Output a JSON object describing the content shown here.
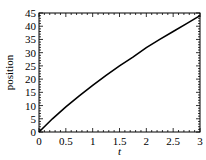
{
  "chart_data": {
    "type": "line",
    "title": "",
    "xlabel": "t",
    "ylabel": "position",
    "xlim": [
      0,
      3
    ],
    "ylim": [
      0,
      45
    ],
    "grid": false,
    "legend": null,
    "x_ticks": [
      0,
      0.5,
      1,
      1.5,
      2,
      2.5,
      3
    ],
    "x_tick_labels": [
      "0",
      "0.5",
      "1",
      "1.5",
      "2",
      "2.5",
      "3"
    ],
    "y_ticks": [
      0,
      5,
      10,
      15,
      20,
      25,
      30,
      35,
      40,
      45
    ],
    "y_tick_labels": [
      "0",
      "5",
      "10",
      "15",
      "20",
      "25",
      "30",
      "35",
      "40",
      "45"
    ],
    "series": [
      {
        "name": "position",
        "color": "#000000",
        "x": [
          0,
          0.25,
          0.5,
          0.75,
          1,
          1.25,
          1.5,
          1.75,
          2,
          2.25,
          2.5,
          2.75,
          3
        ],
        "values": [
          0,
          5,
          9.5,
          13.7,
          17.6,
          21.4,
          25,
          28.3,
          31.9,
          35,
          38,
          41,
          44
        ]
      }
    ]
  }
}
